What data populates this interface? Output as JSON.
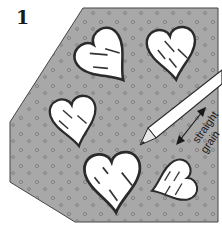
{
  "figure": {
    "step_number": "1",
    "grain_label_line1": "straight",
    "grain_label_line2": "grain",
    "colors": {
      "fabric": "#a8a8a8",
      "outline": "#2a2a2a",
      "paper": "#ffffff"
    },
    "pieces": [
      {
        "name": "heart-top-left"
      },
      {
        "name": "heart-top-right"
      },
      {
        "name": "heart-middle-left"
      },
      {
        "name": "heart-bottom-center"
      },
      {
        "name": "heart-bottom-right"
      }
    ],
    "tool": "fabric-marking-pencil"
  }
}
